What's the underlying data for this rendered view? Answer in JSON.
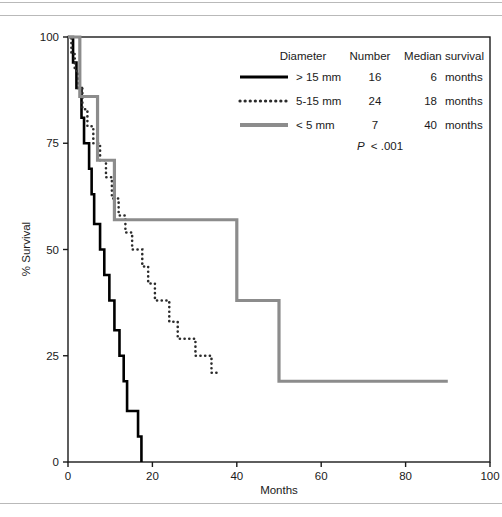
{
  "figure": {
    "axes": {
      "xlabel": "Months",
      "ylabel": "% Survival",
      "xticks": [
        "0",
        "20",
        "40",
        "60",
        "80",
        "100"
      ],
      "yticks": [
        "0",
        "25",
        "50",
        "75",
        "100"
      ]
    },
    "legend": {
      "headers": [
        "Diameter",
        "Number",
        "Median survival"
      ],
      "rows": [
        {
          "style": "solid-black",
          "diameter": "> 15 mm",
          "number": "16",
          "median": "6",
          "unit": "months"
        },
        {
          "style": "dotted-black",
          "diameter": "5-15 mm",
          "number": "24",
          "median": "18",
          "unit": "months"
        },
        {
          "style": "solid-gray",
          "diameter": "< 5 mm",
          "number": "7",
          "median": "40",
          "unit": "months"
        }
      ],
      "pvalue_symbol": "P",
      "pvalue_text": "< .001"
    },
    "colors": {
      "series_large": "#000000",
      "series_medium": "#2b2b2b",
      "series_small": "#8c8c8c",
      "axis": "#1a1a1a",
      "rule": "#b9b9b9"
    }
  },
  "chart_data": {
    "type": "line",
    "subtype": "kaplan-meier-step",
    "title": "",
    "xlabel": "Months",
    "ylabel": "% Survival",
    "xlim": [
      0,
      100
    ],
    "ylim": [
      0,
      100
    ],
    "xticks": [
      0,
      20,
      40,
      60,
      80,
      100
    ],
    "yticks": [
      0,
      25,
      50,
      75,
      100
    ],
    "grid": false,
    "legend_position": "upper-right-inside",
    "annotations": [
      "P < .001"
    ],
    "series": [
      {
        "name": "> 15 mm",
        "label": "> 15 mm",
        "number_at_risk": 16,
        "median_survival_months": 6,
        "style": "solid",
        "color": "#000000",
        "width": 2.6,
        "points": [
          [
            0,
            100
          ],
          [
            1.2,
            100
          ],
          [
            1.2,
            94
          ],
          [
            2.0,
            94
          ],
          [
            2.0,
            88
          ],
          [
            3.2,
            88
          ],
          [
            3.2,
            81
          ],
          [
            3.8,
            81
          ],
          [
            3.8,
            75
          ],
          [
            5.0,
            75
          ],
          [
            5.0,
            69
          ],
          [
            5.6,
            69
          ],
          [
            5.6,
            63
          ],
          [
            6.2,
            63
          ],
          [
            6.2,
            56
          ],
          [
            7.6,
            56
          ],
          [
            7.6,
            50
          ],
          [
            8.6,
            50
          ],
          [
            8.6,
            44
          ],
          [
            9.8,
            44
          ],
          [
            9.8,
            38
          ],
          [
            11.0,
            38
          ],
          [
            11.0,
            31
          ],
          [
            12.2,
            31
          ],
          [
            12.2,
            25
          ],
          [
            13.2,
            25
          ],
          [
            13.2,
            19
          ],
          [
            14.0,
            19
          ],
          [
            14.0,
            12
          ],
          [
            16.6,
            12
          ],
          [
            16.6,
            6
          ],
          [
            17.4,
            6
          ],
          [
            17.4,
            0
          ]
        ]
      },
      {
        "name": "5-15 mm",
        "label": "5-15 mm",
        "number_at_risk": 24,
        "median_survival_months": 18,
        "style": "dotted",
        "color": "#2b2b2b",
        "width": 2.6,
        "censored_end": true,
        "points": [
          [
            0,
            100
          ],
          [
            0.8,
            100
          ],
          [
            0.8,
            96
          ],
          [
            1.6,
            96
          ],
          [
            1.6,
            92
          ],
          [
            2.4,
            92
          ],
          [
            2.4,
            88
          ],
          [
            3.4,
            88
          ],
          [
            3.4,
            83
          ],
          [
            4.6,
            83
          ],
          [
            4.6,
            79
          ],
          [
            6.0,
            79
          ],
          [
            6.0,
            75
          ],
          [
            7.6,
            75
          ],
          [
            7.6,
            71
          ],
          [
            9.0,
            71
          ],
          [
            9.0,
            67
          ],
          [
            10.4,
            67
          ],
          [
            10.4,
            62
          ],
          [
            12.0,
            62
          ],
          [
            12.0,
            58
          ],
          [
            13.6,
            58
          ],
          [
            13.6,
            54
          ],
          [
            15.2,
            54
          ],
          [
            15.2,
            50
          ],
          [
            17.6,
            50
          ],
          [
            17.6,
            46
          ],
          [
            19.0,
            46
          ],
          [
            19.0,
            42
          ],
          [
            20.6,
            42
          ],
          [
            20.6,
            38
          ],
          [
            24.0,
            38
          ],
          [
            24.0,
            33
          ],
          [
            26.0,
            33
          ],
          [
            26.0,
            29
          ],
          [
            30.2,
            29
          ],
          [
            30.2,
            25
          ],
          [
            34.0,
            25
          ],
          [
            34.0,
            21
          ],
          [
            36.0,
            21
          ]
        ]
      },
      {
        "name": "< 5 mm",
        "label": "< 5 mm",
        "number_at_risk": 7,
        "median_survival_months": 40,
        "style": "solid",
        "color": "#8c8c8c",
        "width": 3.2,
        "censored_end": true,
        "points": [
          [
            0,
            100
          ],
          [
            2.8,
            100
          ],
          [
            2.8,
            86
          ],
          [
            7.0,
            86
          ],
          [
            7.0,
            71
          ],
          [
            11.0,
            71
          ],
          [
            11.0,
            57
          ],
          [
            40.0,
            57
          ],
          [
            40.0,
            38
          ],
          [
            50.0,
            38
          ],
          [
            50.0,
            19
          ],
          [
            90.0,
            19
          ]
        ]
      }
    ]
  }
}
